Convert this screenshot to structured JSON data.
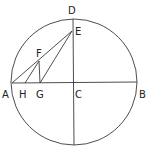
{
  "diagram": {
    "type": "geometry-circle-construction",
    "circle": {
      "center": "C",
      "cx": 74,
      "cy": 82,
      "r": 63
    },
    "points": {
      "A": {
        "x": 12,
        "y": 83,
        "label": "A",
        "lx": 2,
        "ly": 98
      },
      "H": {
        "x": 25,
        "y": 83,
        "label": "H",
        "lx": 19,
        "ly": 98
      },
      "G": {
        "x": 40,
        "y": 83,
        "label": "G",
        "lx": 36,
        "ly": 98
      },
      "C": {
        "x": 74,
        "y": 83,
        "label": "C",
        "lx": 75,
        "ly": 98
      },
      "B": {
        "x": 137,
        "y": 82,
        "label": "B",
        "lx": 139,
        "ly": 98
      },
      "D": {
        "x": 73,
        "y": 19,
        "label": "D",
        "lx": 68,
        "ly": 14
      },
      "E": {
        "x": 72,
        "y": 31,
        "label": "E",
        "lx": 75,
        "ly": 35
      },
      "F": {
        "x": 39,
        "y": 61,
        "label": "F",
        "lx": 36,
        "ly": 57
      }
    },
    "segments": [
      [
        "A",
        "B"
      ],
      [
        "D",
        "bottom"
      ],
      [
        "A",
        "E"
      ],
      [
        "G",
        "E"
      ],
      [
        "F",
        "G"
      ],
      [
        "H",
        "F"
      ]
    ],
    "labels": [
      "A",
      "H",
      "G",
      "C",
      "B",
      "D",
      "E",
      "F"
    ],
    "colors": {
      "stroke": "#3a3a3a",
      "text": "#222222",
      "background": "#ffffff"
    }
  }
}
